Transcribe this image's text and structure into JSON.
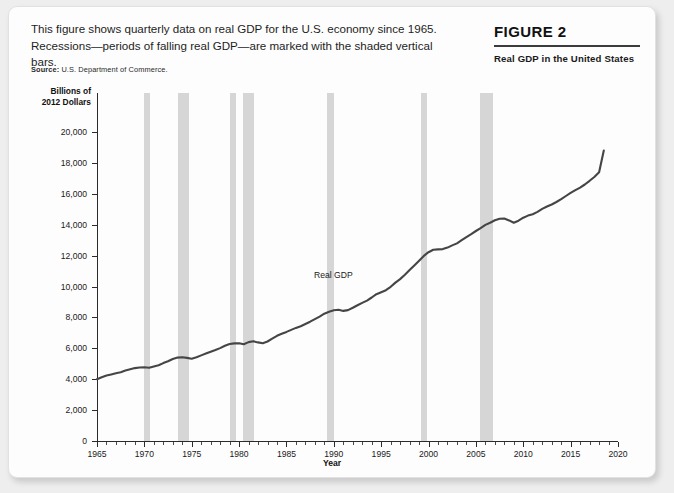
{
  "header": {
    "caption": "This figure shows quarterly data on real GDP for the U.S. economy since 1965. Recessions—periods of falling real GDP—are marked with the shaded vertical bars.",
    "source_label": "Source:",
    "source_text": "U.S. Department of Commerce.",
    "figure_number": "FIGURE 2",
    "figure_subtitle": "Real GDP in the United States"
  },
  "chart_data": {
    "type": "line",
    "title": "Real GDP in the United States",
    "xlabel": "Year",
    "ylabel": "Billions of 2012 Dollars",
    "ylabel_line1": "Billions of",
    "ylabel_line2": "2012 Dollars",
    "xlim": [
      1965,
      2020
    ],
    "ylim": [
      0,
      20000
    ],
    "grid": false,
    "legend_position": "inline-annotation",
    "ytick_labels": [
      "0",
      "2,000",
      "4,000",
      "6,000",
      "8,000",
      "10,000",
      "12,000",
      "14,000",
      "16,000",
      "18,000",
      "20,000"
    ],
    "yticks": [
      0,
      2000,
      4000,
      6000,
      8000,
      10000,
      12000,
      14000,
      16000,
      18000,
      20000
    ],
    "xtick_labels": [
      "1965",
      "1970",
      "1975",
      "1980",
      "1985",
      "1990",
      "1995",
      "2000",
      "2005",
      "2010",
      "2015",
      "2020"
    ],
    "xticks": [
      1965,
      1970,
      1975,
      1980,
      1985,
      1990,
      1995,
      2000,
      2005,
      2010,
      2015,
      2020
    ],
    "xtick_minor_step": 1,
    "series": [
      {
        "name": "Real GDP",
        "annotation": "Real GDP",
        "color": "#454545",
        "x": [
          1965,
          1965.5,
          1966,
          1966.5,
          1967,
          1967.5,
          1968,
          1968.5,
          1969,
          1969.5,
          1970,
          1970.5,
          1971,
          1971.5,
          1972,
          1972.5,
          1973,
          1973.5,
          1974,
          1974.5,
          1975,
          1975.5,
          1976,
          1976.5,
          1977,
          1977.5,
          1978,
          1978.5,
          1979,
          1979.5,
          1980,
          1980.5,
          1981,
          1981.5,
          1982,
          1982.5,
          1983,
          1983.5,
          1984,
          1984.5,
          1985,
          1985.5,
          1986,
          1986.5,
          1987,
          1987.5,
          1988,
          1988.5,
          1989,
          1989.5,
          1990,
          1990.5,
          1991,
          1991.5,
          1992,
          1992.5,
          1993,
          1993.5,
          1994,
          1994.5,
          1995,
          1995.5,
          1996,
          1996.5,
          1997,
          1997.5,
          1998,
          1998.5,
          1999,
          1999.5,
          2000,
          2000.5,
          2001,
          2001.5,
          2002,
          2002.5,
          2003,
          2003.5,
          2004,
          2004.5,
          2005,
          2005.5,
          2006,
          2006.5,
          2007,
          2007.5,
          2008,
          2008.5,
          2009,
          2009.5,
          2010,
          2010.5,
          2011,
          2011.5,
          2012,
          2012.5,
          2013,
          2013.5,
          2014,
          2014.5,
          2015,
          2015.5,
          2016,
          2016.5,
          2017,
          2017.5,
          2018,
          2018.5
        ],
        "y": [
          4000,
          4120,
          4230,
          4310,
          4390,
          4450,
          4560,
          4640,
          4720,
          4760,
          4770,
          4740,
          4820,
          4900,
          5040,
          5160,
          5310,
          5400,
          5420,
          5380,
          5330,
          5420,
          5540,
          5660,
          5780,
          5890,
          6010,
          6170,
          6280,
          6320,
          6330,
          6260,
          6400,
          6450,
          6380,
          6330,
          6440,
          6620,
          6810,
          6940,
          7060,
          7190,
          7320,
          7430,
          7570,
          7720,
          7890,
          8050,
          8240,
          8360,
          8460,
          8490,
          8420,
          8470,
          8620,
          8780,
          8940,
          9090,
          9290,
          9500,
          9630,
          9760,
          9980,
          10250,
          10480,
          10760,
          11060,
          11360,
          11670,
          11980,
          12220,
          12380,
          12400,
          12420,
          12520,
          12660,
          12790,
          13000,
          13200,
          13390,
          13590,
          13780,
          13990,
          14130,
          14290,
          14390,
          14400,
          14280,
          14120,
          14260,
          14450,
          14590,
          14680,
          14830,
          15020,
          15180,
          15310,
          15470,
          15650,
          15860,
          16060,
          16240,
          16400,
          16600,
          16840,
          17090,
          17390,
          18800
        ]
      }
    ],
    "recessions": [
      {
        "label": "1969-1970",
        "start": 1969.9,
        "end": 1970.4
      },
      {
        "label": "1973-1975",
        "start": 1973.2,
        "end": 1974.7
      },
      {
        "label": "1980",
        "start": 1979.6,
        "end": 1980.1
      },
      {
        "label": "1981-1982",
        "start": 1980.6,
        "end": 1982.0
      },
      {
        "label": "1990-1991",
        "start": 1989.9,
        "end": 1990.5
      },
      {
        "label": "2001",
        "start": 1998.8,
        "end": 1999.3
      },
      {
        "label": "2007-2009",
        "start": 2003.4,
        "end": 2004.6
      }
    ],
    "recession_bars_px": [
      {
        "label": "1969-1970",
        "x": 135,
        "width": 6
      },
      {
        "label": "1973-1975",
        "x": 169,
        "width": 11
      },
      {
        "label": "1980",
        "x": 221,
        "width": 6
      },
      {
        "label": "1981-1982",
        "x": 234,
        "width": 11
      },
      {
        "label": "1990-1991",
        "x": 318,
        "width": 7
      },
      {
        "label": "2001",
        "x": 412,
        "width": 6
      },
      {
        "label": "2007-2009",
        "x": 471,
        "width": 13
      }
    ],
    "recession_color": "#d6d6d6"
  }
}
